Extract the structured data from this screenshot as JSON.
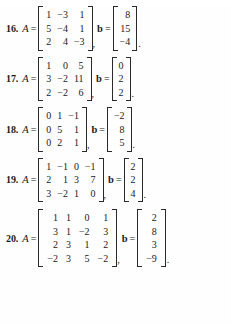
{
  "page": {
    "background_color": "#fefefe",
    "text_color": "#1a1a1a",
    "symbols": {
      "equals": "=",
      "comma": ",",
      "period": ".",
      "matrix_var": "A",
      "vector_var": "b"
    }
  },
  "exercises": [
    {
      "number": "16.",
      "matrix_label": "A",
      "vector_label": "b",
      "equals": "=",
      "comma": ",",
      "period": ".",
      "A": [
        [
          "1",
          "−3",
          "1"
        ],
        [
          "5",
          "−4",
          "1"
        ],
        [
          "2",
          "4",
          "−3"
        ]
      ],
      "b": [
        [
          "8"
        ],
        [
          "15"
        ],
        [
          "−4"
        ]
      ]
    },
    {
      "number": "17.",
      "matrix_label": "A",
      "vector_label": "b",
      "equals": "=",
      "comma": ",",
      "period": ".",
      "A": [
        [
          "1",
          "0",
          "5"
        ],
        [
          "3",
          "−2",
          "11"
        ],
        [
          "2",
          "−2",
          "6"
        ]
      ],
      "b": [
        [
          "0"
        ],
        [
          "2"
        ],
        [
          "2"
        ]
      ]
    },
    {
      "number": "18.",
      "matrix_label": "A",
      "vector_label": "b",
      "equals": "=",
      "comma": ",",
      "period": ".",
      "A": [
        [
          "0",
          "1",
          "−1"
        ],
        [
          "0",
          "5",
          "1"
        ],
        [
          "0",
          "2",
          "1"
        ]
      ],
      "b": [
        [
          "−2"
        ],
        [
          "8"
        ],
        [
          "5"
        ]
      ]
    },
    {
      "number": "19.",
      "matrix_label": "A",
      "vector_label": "b",
      "equals": "=",
      "comma": ",",
      "period": ".",
      "A": [
        [
          "1",
          "−1",
          "0",
          "−1"
        ],
        [
          "2",
          "1",
          "3",
          "7"
        ],
        [
          "3",
          "−2",
          "1",
          "0"
        ]
      ],
      "b": [
        [
          "2"
        ],
        [
          "2"
        ],
        [
          "4"
        ]
      ]
    },
    {
      "number": "20.",
      "matrix_label": "A",
      "vector_label": "b",
      "equals": "=",
      "comma": ",",
      "period": ".",
      "A": [
        [
          "1",
          "1",
          "0",
          "1"
        ],
        [
          "3",
          "1",
          "−2",
          "3"
        ],
        [
          "2",
          "3",
          "1",
          "2"
        ],
        [
          "−2",
          "3",
          "5",
          "−2"
        ]
      ],
      "b": [
        [
          "2"
        ],
        [
          "8"
        ],
        [
          "3"
        ],
        [
          "−9"
        ]
      ]
    }
  ]
}
